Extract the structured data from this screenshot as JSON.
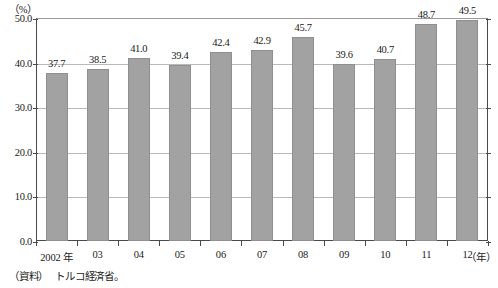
{
  "chart_data": {
    "type": "bar",
    "title": "",
    "xlabel": "（年）",
    "ylabel": "（%）",
    "unit_label": "（%）",
    "xaxis_unit": "（年）",
    "categories": [
      "2002 年",
      "03",
      "04",
      "05",
      "06",
      "07",
      "08",
      "09",
      "10",
      "11",
      "12"
    ],
    "values": [
      37.7,
      38.5,
      41.0,
      39.4,
      42.4,
      42.9,
      45.7,
      39.6,
      40.7,
      48.7,
      49.5
    ],
    "value_labels": [
      "37.7",
      "38.5",
      "41.0",
      "39.4",
      "42.4",
      "42.9",
      "45.7",
      "39.6",
      "40.7",
      "48.7",
      "49.5"
    ],
    "ylim": [
      0.0,
      50.0
    ],
    "yticks": [
      0.0,
      10.0,
      20.0,
      30.0,
      40.0,
      50.0
    ],
    "ytick_labels": [
      "0.0",
      "10.0",
      "20.0",
      "30.0",
      "40.0",
      "50.0"
    ],
    "grid": true,
    "legend": null,
    "bar_color": "#a2a2a2",
    "axis_color": "#4a4a4a",
    "grid_color": "#b9b9b9"
  },
  "source": {
    "label": "（資料）",
    "text": "トルコ経済省。"
  }
}
